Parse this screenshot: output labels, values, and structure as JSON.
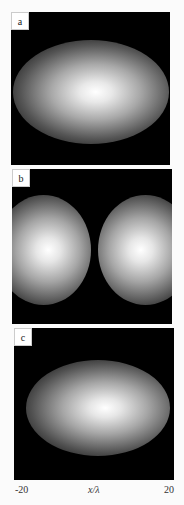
{
  "figure": {
    "panels": [
      {
        "label": "a",
        "description": "single elliptical Gaussian intensity spot, centered"
      },
      {
        "label": "b",
        "description": "two separated round intensity spots"
      },
      {
        "label": "c",
        "description": "single elliptical Gaussian intensity spot, centered"
      }
    ],
    "x_axis": {
      "min_label": "-20",
      "max_label": "20",
      "label": "x/λ"
    },
    "colors": {
      "background": "#fbfbfb",
      "panel": "#000000",
      "peak": "#ffffff"
    }
  }
}
